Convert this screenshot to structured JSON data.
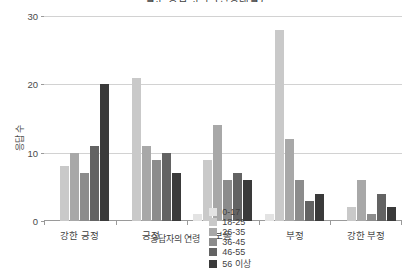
{
  "chart_data": {
    "type": "bar",
    "title": "설문 응답 분포 (연령대별)",
    "xlabel": "",
    "ylabel": "응답 수",
    "ylim": [
      0,
      30
    ],
    "yticks": [
      0,
      10,
      20,
      30
    ],
    "grid": true,
    "legend_position": "bottom",
    "legend_title": "응답자의 연령",
    "categories": [
      "강한 긍정",
      "긍정",
      "보통",
      "부정",
      "강한 부정"
    ],
    "series": [
      {
        "name": "0-17",
        "color": "#e3e3e3",
        "values": [
          0,
          0,
          1,
          1,
          0
        ]
      },
      {
        "name": "18-25",
        "color": "#c9c9c9",
        "values": [
          8,
          21,
          9,
          28,
          2
        ]
      },
      {
        "name": "26-35",
        "color": "#a8a8a8",
        "values": [
          10,
          11,
          14,
          12,
          6
        ]
      },
      {
        "name": "36-45",
        "color": "#8c8c8c",
        "values": [
          7,
          9,
          6,
          6,
          1
        ]
      },
      {
        "name": "46-55",
        "color": "#636363",
        "values": [
          11,
          10,
          7,
          3,
          4
        ]
      },
      {
        "name": "56 이상",
        "color": "#3a3a3a",
        "values": [
          20,
          7,
          6,
          4,
          2
        ]
      }
    ]
  },
  "axis_colors": {
    "gridline": "#d2d2d2",
    "axis": "#9a9a9a",
    "text": "#3f3f3f"
  }
}
